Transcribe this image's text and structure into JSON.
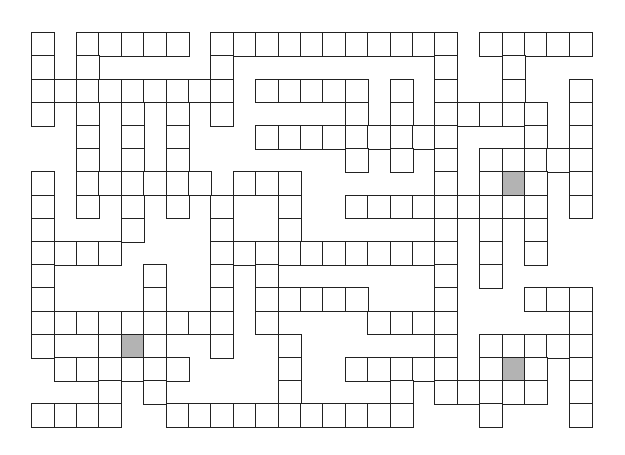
{
  "puzzle": {
    "type": "crossword-grid",
    "cols": 25,
    "rows": 17,
    "cell_width": 22.4,
    "cell_height": 23.2,
    "colors": {
      "border": "#222222",
      "cell": "#ffffff",
      "shaded": "#b3b3b3",
      "background": "#ffffff"
    },
    "rows_cells": [
      [
        0,
        2,
        3,
        4,
        5,
        6,
        8,
        9,
        10,
        11,
        12,
        13,
        14,
        15,
        16,
        17,
        18,
        20,
        21,
        22,
        23,
        24
      ],
      [
        0,
        2,
        8,
        18,
        21
      ],
      [
        0,
        1,
        2,
        3,
        4,
        5,
        6,
        7,
        8,
        10,
        11,
        12,
        13,
        14,
        16,
        18,
        21,
        24
      ],
      [
        0,
        2,
        4,
        6,
        8,
        14,
        16,
        18,
        19,
        20,
        21,
        22,
        24
      ],
      [
        2,
        4,
        6,
        10,
        11,
        12,
        13,
        14,
        15,
        16,
        17,
        18,
        22,
        24
      ],
      [
        2,
        4,
        6,
        14,
        16,
        18,
        20,
        21,
        22,
        23,
        24
      ],
      [
        0,
        2,
        3,
        4,
        5,
        6,
        7,
        9,
        10,
        11,
        18,
        20,
        21,
        22,
        24
      ],
      [
        0,
        2,
        4,
        6,
        8,
        11,
        14,
        15,
        16,
        17,
        18,
        19,
        20,
        21,
        22,
        24
      ],
      [
        0,
        4,
        8,
        11,
        18,
        20,
        22
      ],
      [
        0,
        1,
        2,
        3,
        8,
        9,
        10,
        11,
        12,
        13,
        14,
        15,
        16,
        17,
        18,
        20,
        22
      ],
      [
        0,
        5,
        8,
        10,
        18,
        20
      ],
      [
        0,
        5,
        8,
        10,
        11,
        12,
        13,
        14,
        18,
        22,
        23,
        24
      ],
      [
        0,
        1,
        2,
        3,
        4,
        5,
        6,
        7,
        8,
        10,
        15,
        16,
        17,
        18,
        24
      ],
      [
        0,
        3,
        4,
        5,
        8,
        11,
        18,
        20,
        21,
        22,
        23,
        24
      ],
      [
        1,
        2,
        3,
        4,
        5,
        6,
        11,
        14,
        15,
        16,
        17,
        18,
        20,
        21,
        22,
        24
      ],
      [
        3,
        5,
        11,
        16,
        18,
        19,
        20,
        21,
        22,
        24
      ],
      [
        0,
        1,
        2,
        3,
        6,
        7,
        8,
        9,
        10,
        11,
        12,
        13,
        14,
        15,
        16,
        20,
        24
      ]
    ],
    "merged_cells": [
      {
        "row": 13,
        "col": 1,
        "span": 2
      }
    ],
    "shaded_cells": [
      {
        "row": 6,
        "col": 21
      },
      {
        "row": 13,
        "col": 4
      },
      {
        "row": 14,
        "col": 21
      }
    ]
  }
}
